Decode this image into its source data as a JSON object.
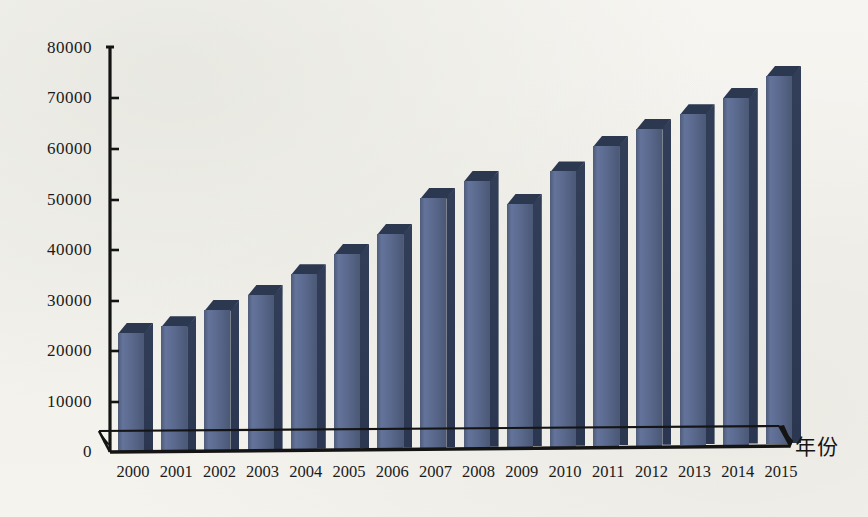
{
  "chart_data": {
    "type": "bar",
    "title": "",
    "subtitle": "",
    "xlabel": "年份",
    "ylabel": "",
    "categories": [
      "2000",
      "2001",
      "2002",
      "2003",
      "2004",
      "2005",
      "2006",
      "2007",
      "2008",
      "2009",
      "2010",
      "2011",
      "2012",
      "2013",
      "2014",
      "2015"
    ],
    "values": [
      23600,
      24800,
      27900,
      30800,
      34800,
      38700,
      42600,
      49600,
      52800,
      48200,
      54500,
      59500,
      62800,
      65500,
      68700,
      72900
    ],
    "series": [
      {
        "name": "",
        "values": [
          23600,
          24800,
          27900,
          30800,
          34800,
          38700,
          42600,
          49600,
          52800,
          48200,
          54500,
          59500,
          62800,
          65500,
          68700,
          72900
        ]
      }
    ],
    "ylim": [
      0,
      80000
    ],
    "yticks": [
      0,
      10000,
      20000,
      30000,
      40000,
      50000,
      60000,
      70000,
      80000
    ],
    "ytick_labels": [
      "0",
      "10000",
      "20000",
      "30000",
      "40000",
      "50000",
      "60000",
      "70000",
      "80000"
    ],
    "grid": false,
    "legend": null,
    "legend_position": "none",
    "style": "3d-column",
    "colors": {
      "bar_front": "#5a6990",
      "bar_side": "#2e3a54",
      "bar_top": "#2c3850",
      "axis": "#141414",
      "text": "#1a1a1a",
      "background": "#f3f2ee"
    }
  },
  "axis": {
    "y_tick_labels": [
      "80000",
      "70000",
      "60000",
      "50000",
      "40000",
      "30000",
      "20000",
      "10000",
      "0"
    ],
    "x_axis_title": "年份"
  }
}
